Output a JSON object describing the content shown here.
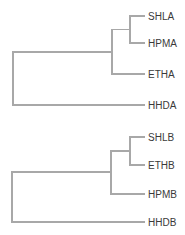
{
  "diagram": {
    "type": "dendrogram",
    "colors": {
      "branch": "#a8a8a8",
      "label": "#3a3a3a",
      "background": "#ffffff"
    },
    "trees": [
      {
        "name": "tree-a",
        "leaves": [
          {
            "label": "SHLA",
            "y": 16
          },
          {
            "label": "HPMA",
            "y": 43
          },
          {
            "label": "ETHA",
            "y": 74
          },
          {
            "label": "HHDA",
            "y": 105
          }
        ],
        "structure": "(HHDA,(ETHA,(SHLA,HPMA)))"
      },
      {
        "name": "tree-b",
        "leaves": [
          {
            "label": "SHLB",
            "y": 137
          },
          {
            "label": "ETHB",
            "y": 165
          },
          {
            "label": "HPMB",
            "y": 194
          },
          {
            "label": "HHDB",
            "y": 222
          }
        ],
        "structure": "(HHDB,(HPMB,(SHLB,ETHB)))"
      }
    ]
  }
}
